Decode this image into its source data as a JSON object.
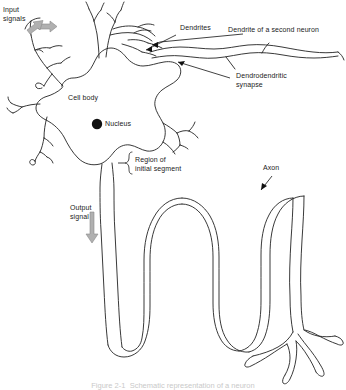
{
  "figure": {
    "background_color": "#ffffff",
    "line_color": "#4a4a4a",
    "label_color": "#1a1a1a",
    "arrow_color": "#b0b0b0",
    "nucleus_color": "#111111",
    "width": 346,
    "height": 390
  },
  "labels": {
    "input_signals": "Input\nsignals",
    "dendrites": "Dendrites",
    "dendrite_second_neuron": "Dendrite of a second neuron",
    "dendrodendritic_synapse": "Dendrodendritic\nsynapse",
    "cell_body": "Cell body",
    "nucleus": "Nucleus",
    "region_initial_segment": "Region of\ninitial segment",
    "output_signal": "Output\nsignal",
    "axon": "Axon"
  },
  "caption": {
    "text": "Figure 2-1  Schematic representation of a neuron"
  },
  "parts": {
    "nucleus_marker": "filled-circle",
    "input_arrow_1": "thick-gray-arrow",
    "input_arrow_2": "thick-gray-arrow",
    "output_arrow": "thick-gray-arrow-down",
    "initial_segment_bracket": "curly-brace"
  }
}
